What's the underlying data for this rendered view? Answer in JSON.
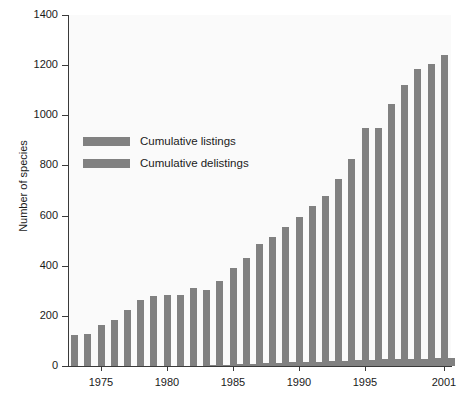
{
  "chart_data": {
    "type": "bar",
    "title": "",
    "xlabel": "",
    "ylabel": "Number of species",
    "ylim": [
      0,
      1400
    ],
    "ytick_values": [
      0,
      200,
      400,
      600,
      800,
      1000,
      1200,
      1400
    ],
    "ytick_labels": [
      "0",
      "200",
      "400",
      "600",
      "800",
      "1000",
      "1200",
      "1400"
    ],
    "grid": false,
    "legend_position": "upper-left-inside",
    "bar_color": "#818181",
    "plot_background": "#fafafa",
    "axis_color": "#3a3a3a",
    "categories": [
      1973,
      1974,
      1975,
      1976,
      1977,
      1978,
      1979,
      1980,
      1981,
      1982,
      1983,
      1984,
      1985,
      1986,
      1987,
      1988,
      1989,
      1990,
      1991,
      1992,
      1993,
      1994,
      1995,
      1996,
      1997,
      1998,
      1999,
      2000,
      2001
    ],
    "xtick_labels": [
      "1975",
      "1980",
      "1985",
      "1990",
      "1995",
      "2001"
    ],
    "xtick_years": [
      1975,
      1980,
      1985,
      1990,
      1995,
      2001
    ],
    "series": [
      {
        "name": "Cumulative listings",
        "values": [
          125,
          127,
          165,
          185,
          225,
          265,
          280,
          283,
          285,
          310,
          305,
          340,
          390,
          430,
          485,
          515,
          555,
          595,
          640,
          680,
          745,
          825,
          950,
          950,
          1045,
          1120,
          1185,
          1205,
          1240
        ]
      },
      {
        "name": "Cumulative delistings",
        "values": [
          0,
          0,
          0,
          0,
          0,
          0,
          0,
          0,
          0,
          0,
          3,
          4,
          6,
          8,
          10,
          12,
          14,
          16,
          17,
          18,
          20,
          24,
          25,
          26,
          27,
          28,
          29,
          30,
          31
        ]
      }
    ]
  },
  "legend": {
    "items": [
      {
        "label": "Cumulative listings",
        "color": "#818181"
      },
      {
        "label": "Cumulative delistings",
        "color": "#818181"
      }
    ]
  }
}
